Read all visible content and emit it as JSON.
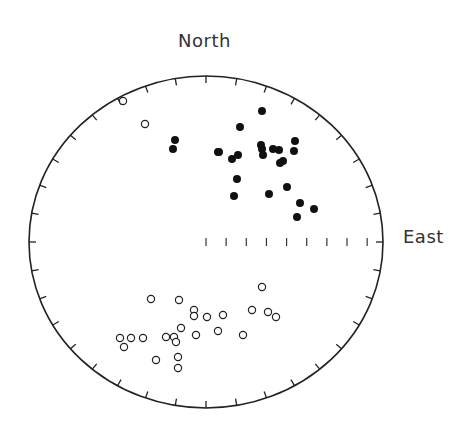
{
  "chart_data": {
    "type": "scatter",
    "subtype": "stereonet",
    "title": "",
    "labels": {
      "north": "North",
      "east": "East"
    },
    "geometry": {
      "cx": 206,
      "cy": 242,
      "rx": 177,
      "ry": 166,
      "perimeter_tick_deg": 10,
      "east_radius_ticks": 9
    },
    "legend": [],
    "series": [
      {
        "name": "filled",
        "marker": "filled-circle",
        "points": [
          [
            262,
            111
          ],
          [
            240,
            127
          ],
          [
            175,
            140
          ],
          [
            173,
            149
          ],
          [
            218,
            152
          ],
          [
            219,
            152
          ],
          [
            232,
            159
          ],
          [
            238,
            155
          ],
          [
            261,
            145
          ],
          [
            262,
            149
          ],
          [
            263,
            155
          ],
          [
            273,
            149
          ],
          [
            279,
            150
          ],
          [
            295,
            141
          ],
          [
            294,
            151
          ],
          [
            280,
            163
          ],
          [
            283,
            161
          ],
          [
            237,
            179
          ],
          [
            234,
            196
          ],
          [
            269,
            194
          ],
          [
            287,
            187
          ],
          [
            300,
            203
          ],
          [
            314,
            209
          ],
          [
            297,
            217
          ]
        ]
      },
      {
        "name": "open",
        "marker": "open-circle",
        "points": [
          [
            123,
            101
          ],
          [
            145,
            124
          ],
          [
            262,
            287
          ],
          [
            151,
            299
          ],
          [
            179,
            300
          ],
          [
            194,
            310
          ],
          [
            194,
            316
          ],
          [
            207,
            317
          ],
          [
            223,
            315
          ],
          [
            252,
            310
          ],
          [
            268,
            312
          ],
          [
            276,
            317
          ],
          [
            181,
            328
          ],
          [
            120,
            338
          ],
          [
            131,
            338
          ],
          [
            143,
            338
          ],
          [
            166,
            337
          ],
          [
            174,
            337
          ],
          [
            176,
            342
          ],
          [
            196,
            335
          ],
          [
            218,
            331
          ],
          [
            243,
            335
          ],
          [
            124,
            347
          ],
          [
            156,
            360
          ],
          [
            178,
            357
          ],
          [
            178,
            368
          ]
        ]
      }
    ]
  }
}
